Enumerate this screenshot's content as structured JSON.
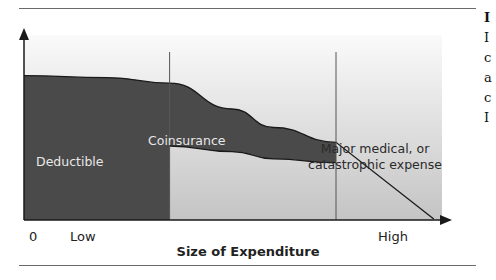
{
  "chart_data": {
    "type": "area",
    "title": "",
    "xlabel": "Size of Expenditure",
    "ylabel": "",
    "x_tick_labels": [
      "0",
      "Low",
      "High"
    ],
    "regions": [
      {
        "name": "Deductible",
        "label": "Deductible"
      },
      {
        "name": "Coinsurance",
        "label": "Coinsurance"
      },
      {
        "name": "Major medical",
        "label_lines": [
          "Major medical, or",
          "catastrophic expense"
        ]
      }
    ],
    "upper_curve": {
      "x": [
        0,
        0.2,
        0.35,
        0.5,
        0.6,
        0.75,
        1.0
      ],
      "y": [
        0.78,
        0.77,
        0.74,
        0.6,
        0.5,
        0.42,
        0.0
      ]
    },
    "coinsurance_lower_curve": {
      "x": [
        0.35,
        0.5,
        0.6,
        0.75
      ],
      "y": [
        0.4,
        0.37,
        0.33,
        0.31
      ]
    },
    "region_boundaries_x": [
      0.35,
      0.75
    ],
    "colors": {
      "dark_area": "#4a4a4a",
      "light_area": "#c8c8c8",
      "background_top": "#f4f4f4",
      "line": "#1a1a1a"
    }
  },
  "side_text_chars": [
    "I",
    "I",
    "c",
    "a",
    "c",
    "I"
  ]
}
